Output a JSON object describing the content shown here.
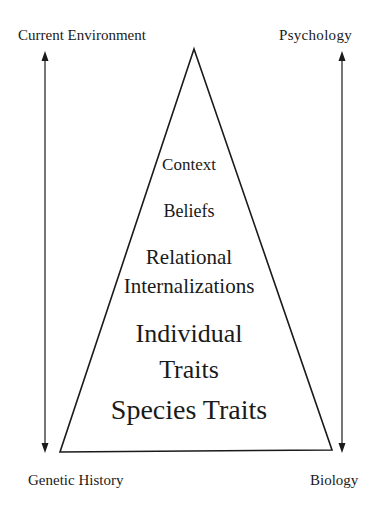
{
  "corner_labels": {
    "top_left": "Current Environment",
    "top_right": "Psychology",
    "bottom_left": "Genetic History",
    "bottom_right": "Biology"
  },
  "pyramid_layers": [
    {
      "label": "Context"
    },
    {
      "label": "Beliefs"
    },
    {
      "label": "Relational"
    },
    {
      "label": "Internalizations"
    },
    {
      "label": "Individual"
    },
    {
      "label": "Traits"
    },
    {
      "label": "Species Traits"
    }
  ],
  "arrows": {
    "left": {
      "direction": "bidirectional",
      "from": "Current Environment",
      "to": "Genetic History"
    },
    "right": {
      "direction": "bidirectional",
      "from": "Psychology",
      "to": "Biology"
    }
  },
  "colors": {
    "ink": "#1a1a1a",
    "background": "#ffffff"
  }
}
